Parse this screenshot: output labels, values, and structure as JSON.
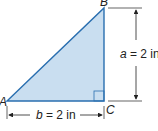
{
  "diagram": {
    "type": "right-triangle",
    "fill_color": "#c9def0",
    "stroke_color": "#2a6fb0",
    "vertices": {
      "A": {
        "label": "A"
      },
      "B": {
        "label": "B"
      },
      "C": {
        "label": "C"
      }
    },
    "right_angle_at": "C",
    "dimensions": {
      "side_a": {
        "var": "a",
        "text": " = 2 in"
      },
      "side_b": {
        "var": "b",
        "text": " = 2 in"
      }
    }
  }
}
